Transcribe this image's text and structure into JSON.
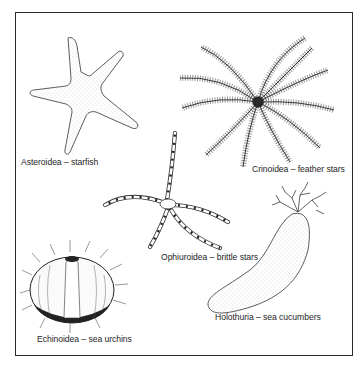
{
  "figure": {
    "border_color": "#2a2a2a",
    "ink_color": "#1e1e1e",
    "background": "#ffffff",
    "specimens": [
      {
        "id": "asteroidea",
        "label": "Asteroidea – starfish",
        "icon": "starfish-illustration"
      },
      {
        "id": "crinoidea",
        "label": "Crinoidea – feather stars",
        "icon": "feather-star-illustration"
      },
      {
        "id": "ophiuroidea",
        "label": "Ophiuroidea – brittle stars",
        "icon": "brittle-star-illustration"
      },
      {
        "id": "holothuria",
        "label": "Holothuria – sea cucumbers",
        "icon": "sea-cucumber-illustration"
      },
      {
        "id": "echinoidea",
        "label": "Echinoidea – sea urchins",
        "icon": "sea-urchin-illustration"
      }
    ]
  }
}
